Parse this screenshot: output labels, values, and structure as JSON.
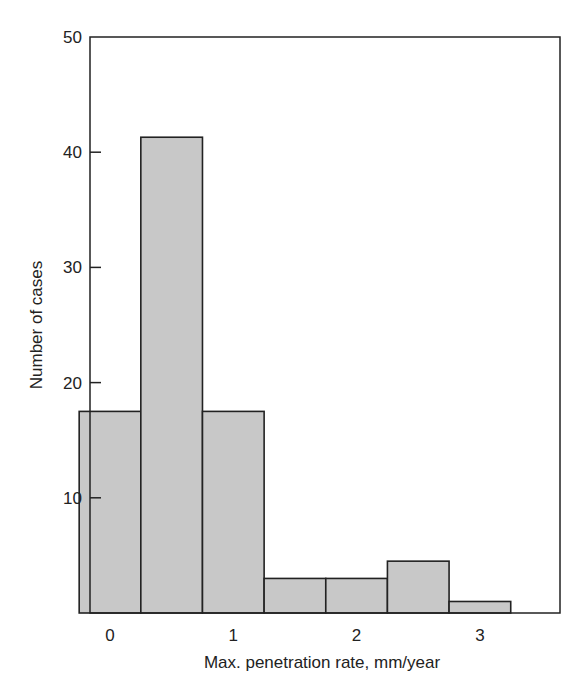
{
  "chart_data": {
    "type": "bar",
    "subtype": "histogram",
    "title": "",
    "xlabel": "Max. penetration rate, mm/year",
    "ylabel": "Number of cases",
    "xlim": [
      -0.25,
      3.75
    ],
    "ylim": [
      0,
      50
    ],
    "x_ticks": [
      0,
      1,
      2,
      3
    ],
    "x_tick_labels": [
      "0",
      "1",
      "2",
      "3"
    ],
    "y_ticks": [
      10,
      20,
      30,
      40,
      50
    ],
    "y_tick_labels": [
      "10",
      "20",
      "30",
      "40",
      "50"
    ],
    "bin_width": 0.5,
    "bins": [
      {
        "start": -0.25,
        "end": 0.25,
        "value": 17.5
      },
      {
        "start": 0.25,
        "end": 0.75,
        "value": 41.3
      },
      {
        "start": 0.75,
        "end": 1.25,
        "value": 17.5
      },
      {
        "start": 1.25,
        "end": 1.75,
        "value": 3
      },
      {
        "start": 1.75,
        "end": 2.25,
        "value": 3
      },
      {
        "start": 2.25,
        "end": 2.75,
        "value": 4.5
      },
      {
        "start": 2.75,
        "end": 3.25,
        "value": 1
      }
    ],
    "categories": [
      "0",
      "0.5",
      "1",
      "1.5",
      "2",
      "2.5",
      "3"
    ],
    "values": [
      17.5,
      41.3,
      17.5,
      3,
      3,
      4.5,
      1
    ],
    "grid": false,
    "legend": null,
    "colors": {
      "bar_fill": "#c8c8c8",
      "bar_edge": "#222222",
      "axis": "#222222"
    }
  }
}
